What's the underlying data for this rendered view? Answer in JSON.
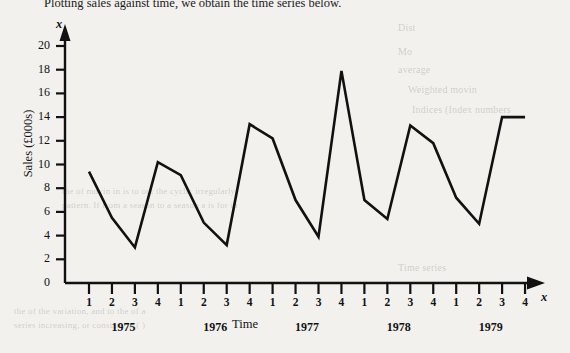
{
  "page": {
    "intro_text": "Plotting sales against time, we obtain the time series below.",
    "background_color": "#f2f1ee",
    "ink_color": "#141414"
  },
  "chart_data": {
    "type": "line",
    "title": "",
    "xlabel": "Time",
    "ylabel": "Sales (£000s)",
    "y_axis_variable": "x",
    "x_axis_variable": "x",
    "ylim": [
      0,
      20
    ],
    "y_ticks": [
      0,
      2,
      4,
      6,
      8,
      10,
      12,
      14,
      16,
      18,
      20
    ],
    "grid": false,
    "legend": null,
    "line_color": "#111111",
    "categories": [
      "1975 Q1",
      "1975 Q2",
      "1975 Q3",
      "1975 Q4",
      "1976 Q1",
      "1976 Q2",
      "1976 Q3",
      "1976 Q4",
      "1977 Q1",
      "1977 Q2",
      "1977 Q3",
      "1977 Q4",
      "1978 Q1",
      "1978 Q2",
      "1978 Q3",
      "1978 Q4",
      "1979 Q1",
      "1979 Q2",
      "1979 Q3",
      "1979 Q4"
    ],
    "quarter_labels": [
      "1",
      "2",
      "3",
      "4",
      "1",
      "2",
      "3",
      "4",
      "1",
      "2",
      "3",
      "4",
      "1",
      "2",
      "3",
      "4",
      "1",
      "2",
      "3",
      "4"
    ],
    "year_labels": [
      "1975",
      "1976",
      "1977",
      "1978",
      "1979"
    ],
    "values": [
      9.4,
      5.5,
      3.0,
      10.2,
      9.1,
      5.1,
      3.2,
      13.4,
      12.2,
      7.0,
      3.9,
      17.9,
      7.0,
      5.4,
      13.3,
      11.8,
      7.2,
      5.0,
      14.0,
      14.0
    ]
  },
  "ghost_text": {
    "right_column": [
      "Dist",
      "Mo",
      "average",
      "Weighted movin",
      "Indices (Index numbers",
      "Example 1"
    ],
    "body_lines": [
      "the of movin in is to out the cyclic irregularly",
      "pattern. If from a season to a season a is for in",
      "Time series",
      "the of the variation, and to the of a",
      "series increasing, or constant in ( )"
    ]
  }
}
